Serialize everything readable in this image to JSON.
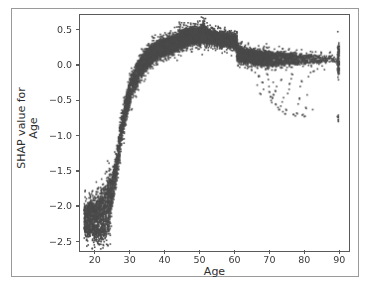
{
  "figure": {
    "top_clipped_text": "",
    "caption_clipped_text": ""
  },
  "chart_data": {
    "type": "scatter",
    "title": "",
    "subtitle": "",
    "xlabel": "Age",
    "ylabel_line1": "SHAP value for",
    "ylabel_line2": "Age",
    "ylabel": "SHAP value for Age",
    "xlim": [
      15.5,
      92.5
    ],
    "ylim": [
      -2.62,
      0.72
    ],
    "xticks": [
      20,
      30,
      40,
      50,
      60,
      70,
      80,
      90
    ],
    "xticklabels": [
      "20",
      "30",
      "40",
      "50",
      "60",
      "70",
      "80",
      "90"
    ],
    "yticks": [
      0.5,
      0.0,
      -0.5,
      -1.0,
      -1.5,
      -2.0,
      -2.5
    ],
    "yticklabels": [
      "0.5",
      "0.0",
      "−0.5",
      "−1.0",
      "−1.5",
      "−2.0",
      "−2.5"
    ],
    "grid": false,
    "legend": null,
    "marker_color": "#4a4a4a",
    "marker_size": 1.6,
    "n_points_approx": 9000,
    "bands": [
      {
        "x": 17.0,
        "lo": -2.36,
        "hi": -2.02,
        "density": 1.0
      },
      {
        "x": 17.6,
        "lo": -2.4,
        "hi": -2.0,
        "density": 1.0
      },
      {
        "x": 18.2,
        "lo": -2.42,
        "hi": -1.98,
        "density": 1.0
      },
      {
        "x": 18.8,
        "lo": -2.44,
        "hi": -1.96,
        "density": 1.0
      },
      {
        "x": 19.4,
        "lo": -2.46,
        "hi": -1.94,
        "density": 1.0
      },
      {
        "x": 20.0,
        "lo": -2.47,
        "hi": -1.92,
        "density": 1.0
      },
      {
        "x": 20.6,
        "lo": -2.47,
        "hi": -1.9,
        "density": 1.0
      },
      {
        "x": 21.2,
        "lo": -2.46,
        "hi": -1.88,
        "density": 1.0
      },
      {
        "x": 21.8,
        "lo": -2.45,
        "hi": -1.84,
        "density": 1.0
      },
      {
        "x": 22.4,
        "lo": -2.43,
        "hi": -1.8,
        "density": 1.0
      },
      {
        "x": 23.0,
        "lo": -2.4,
        "hi": -1.74,
        "density": 1.0
      },
      {
        "x": 23.6,
        "lo": -2.36,
        "hi": -1.66,
        "density": 0.95
      },
      {
        "x": 24.0,
        "lo": -2.3,
        "hi": -1.56,
        "density": 0.8
      },
      {
        "x": 24.4,
        "lo": -2.1,
        "hi": -1.62,
        "density": 0.65
      },
      {
        "x": 24.8,
        "lo": -1.96,
        "hi": -1.58,
        "density": 0.6
      },
      {
        "x": 25.2,
        "lo": -1.86,
        "hi": -1.5,
        "density": 0.6
      },
      {
        "x": 25.6,
        "lo": -1.74,
        "hi": -1.4,
        "density": 0.6
      },
      {
        "x": 26.0,
        "lo": -1.62,
        "hi": -1.28,
        "density": 0.6
      },
      {
        "x": 26.4,
        "lo": -1.48,
        "hi": -1.14,
        "density": 0.6
      },
      {
        "x": 26.8,
        "lo": -1.34,
        "hi": -1.0,
        "density": 0.6
      },
      {
        "x": 27.2,
        "lo": -1.2,
        "hi": -0.86,
        "density": 0.6
      },
      {
        "x": 27.6,
        "lo": -1.06,
        "hi": -0.74,
        "density": 0.6
      },
      {
        "x": 28.0,
        "lo": -0.94,
        "hi": -0.62,
        "density": 0.62
      },
      {
        "x": 28.4,
        "lo": -0.84,
        "hi": -0.52,
        "density": 0.64
      },
      {
        "x": 28.8,
        "lo": -0.74,
        "hi": -0.44,
        "density": 0.66
      },
      {
        "x": 29.2,
        "lo": -0.66,
        "hi": -0.36,
        "density": 0.68
      },
      {
        "x": 29.6,
        "lo": -0.58,
        "hi": -0.28,
        "density": 0.7
      },
      {
        "x": 30.0,
        "lo": -0.5,
        "hi": -0.2,
        "density": 0.72
      },
      {
        "x": 30.6,
        "lo": -0.42,
        "hi": -0.12,
        "density": 0.74
      },
      {
        "x": 31.2,
        "lo": -0.34,
        "hi": -0.05,
        "density": 0.76
      },
      {
        "x": 31.8,
        "lo": -0.28,
        "hi": 0.01,
        "density": 0.78
      },
      {
        "x": 32.4,
        "lo": -0.22,
        "hi": 0.06,
        "density": 0.8
      },
      {
        "x": 33.0,
        "lo": -0.17,
        "hi": 0.11,
        "density": 0.82
      },
      {
        "x": 33.6,
        "lo": -0.12,
        "hi": 0.15,
        "density": 0.84
      },
      {
        "x": 34.2,
        "lo": -0.08,
        "hi": 0.19,
        "density": 0.86
      },
      {
        "x": 34.8,
        "lo": -0.04,
        "hi": 0.22,
        "density": 0.88
      },
      {
        "x": 35.4,
        "lo": -0.01,
        "hi": 0.25,
        "density": 0.9
      },
      {
        "x": 36.0,
        "lo": 0.02,
        "hi": 0.28,
        "density": 0.92
      },
      {
        "x": 36.6,
        "lo": 0.05,
        "hi": 0.3,
        "density": 0.93
      },
      {
        "x": 37.2,
        "lo": 0.08,
        "hi": 0.32,
        "density": 0.94
      },
      {
        "x": 37.8,
        "lo": 0.1,
        "hi": 0.33,
        "density": 0.95
      },
      {
        "x": 38.4,
        "lo": 0.12,
        "hi": 0.35,
        "density": 0.95
      },
      {
        "x": 39.0,
        "lo": 0.13,
        "hi": 0.36,
        "density": 0.95
      },
      {
        "x": 39.6,
        "lo": 0.14,
        "hi": 0.37,
        "density": 0.95
      },
      {
        "x": 40.2,
        "lo": 0.15,
        "hi": 0.38,
        "density": 0.95
      },
      {
        "x": 40.8,
        "lo": 0.16,
        "hi": 0.39,
        "density": 0.95
      },
      {
        "x": 41.4,
        "lo": 0.17,
        "hi": 0.4,
        "density": 0.95
      },
      {
        "x": 42.0,
        "lo": 0.18,
        "hi": 0.41,
        "density": 0.95
      },
      {
        "x": 42.6,
        "lo": 0.19,
        "hi": 0.42,
        "density": 0.95
      },
      {
        "x": 43.2,
        "lo": 0.2,
        "hi": 0.43,
        "density": 0.95
      },
      {
        "x": 43.8,
        "lo": 0.21,
        "hi": 0.45,
        "density": 0.96
      },
      {
        "x": 44.4,
        "lo": 0.24,
        "hi": 0.49,
        "density": 1.0
      },
      {
        "x": 45.0,
        "lo": 0.26,
        "hi": 0.5,
        "density": 1.0
      },
      {
        "x": 45.6,
        "lo": 0.27,
        "hi": 0.5,
        "density": 1.0
      },
      {
        "x": 46.2,
        "lo": 0.28,
        "hi": 0.51,
        "density": 1.0
      },
      {
        "x": 46.8,
        "lo": 0.29,
        "hi": 0.51,
        "density": 1.0
      },
      {
        "x": 47.4,
        "lo": 0.29,
        "hi": 0.52,
        "density": 1.0
      },
      {
        "x": 48.0,
        "lo": 0.3,
        "hi": 0.52,
        "density": 1.0
      },
      {
        "x": 48.6,
        "lo": 0.3,
        "hi": 0.53,
        "density": 1.0
      },
      {
        "x": 49.2,
        "lo": 0.31,
        "hi": 0.53,
        "density": 1.0
      },
      {
        "x": 49.8,
        "lo": 0.31,
        "hi": 0.54,
        "density": 1.0
      },
      {
        "x": 50.4,
        "lo": 0.32,
        "hi": 0.55,
        "density": 1.0
      },
      {
        "x": 51.0,
        "lo": 0.32,
        "hi": 0.58,
        "density": 1.0
      },
      {
        "x": 51.6,
        "lo": 0.32,
        "hi": 0.55,
        "density": 1.0
      },
      {
        "x": 52.2,
        "lo": 0.32,
        "hi": 0.52,
        "density": 1.0
      },
      {
        "x": 52.8,
        "lo": 0.31,
        "hi": 0.5,
        "density": 1.0
      },
      {
        "x": 53.4,
        "lo": 0.31,
        "hi": 0.49,
        "density": 1.0
      },
      {
        "x": 54.0,
        "lo": 0.3,
        "hi": 0.48,
        "density": 1.0
      },
      {
        "x": 54.6,
        "lo": 0.3,
        "hi": 0.48,
        "density": 1.0
      },
      {
        "x": 55.2,
        "lo": 0.29,
        "hi": 0.47,
        "density": 1.0
      },
      {
        "x": 55.8,
        "lo": 0.29,
        "hi": 0.47,
        "density": 1.0
      },
      {
        "x": 56.4,
        "lo": 0.28,
        "hi": 0.46,
        "density": 1.0
      },
      {
        "x": 57.0,
        "lo": 0.28,
        "hi": 0.46,
        "density": 1.0
      },
      {
        "x": 57.6,
        "lo": 0.27,
        "hi": 0.45,
        "density": 1.0
      },
      {
        "x": 58.2,
        "lo": 0.27,
        "hi": 0.45,
        "density": 1.0
      },
      {
        "x": 58.8,
        "lo": 0.26,
        "hi": 0.45,
        "density": 1.0
      },
      {
        "x": 59.4,
        "lo": 0.26,
        "hi": 0.44,
        "density": 1.0
      },
      {
        "x": 60.0,
        "lo": 0.25,
        "hi": 0.44,
        "density": 1.0
      },
      {
        "x": 60.6,
        "lo": 0.24,
        "hi": 0.43,
        "density": 1.0
      },
      {
        "x": 61.0,
        "lo": 0.08,
        "hi": 0.3,
        "density": 0.9
      },
      {
        "x": 61.6,
        "lo": 0.06,
        "hi": 0.26,
        "density": 0.88
      },
      {
        "x": 62.2,
        "lo": 0.05,
        "hi": 0.24,
        "density": 0.86
      },
      {
        "x": 62.8,
        "lo": 0.04,
        "hi": 0.23,
        "density": 0.85
      },
      {
        "x": 63.4,
        "lo": 0.04,
        "hi": 0.22,
        "density": 0.84
      },
      {
        "x": 64.0,
        "lo": 0.03,
        "hi": 0.22,
        "density": 0.83
      },
      {
        "x": 64.6,
        "lo": 0.03,
        "hi": 0.21,
        "density": 0.82
      },
      {
        "x": 65.2,
        "lo": 0.02,
        "hi": 0.21,
        "density": 0.81
      },
      {
        "x": 65.8,
        "lo": 0.02,
        "hi": 0.2,
        "density": 0.8
      },
      {
        "x": 66.4,
        "lo": 0.02,
        "hi": 0.2,
        "density": 0.79
      },
      {
        "x": 67.0,
        "lo": 0.01,
        "hi": 0.2,
        "density": 0.78
      },
      {
        "x": 67.6,
        "lo": 0.01,
        "hi": 0.19,
        "density": 0.77
      },
      {
        "x": 68.2,
        "lo": 0.01,
        "hi": 0.19,
        "density": 0.75
      },
      {
        "x": 68.8,
        "lo": 0.0,
        "hi": 0.19,
        "density": 0.73
      },
      {
        "x": 69.4,
        "lo": 0.0,
        "hi": 0.19,
        "density": 0.71
      },
      {
        "x": 70.0,
        "lo": 0.0,
        "hi": 0.19,
        "density": 0.69
      },
      {
        "x": 70.8,
        "lo": 0.0,
        "hi": 0.18,
        "density": 0.66
      },
      {
        "x": 71.6,
        "lo": 0.0,
        "hi": 0.18,
        "density": 0.63
      },
      {
        "x": 72.4,
        "lo": 0.0,
        "hi": 0.18,
        "density": 0.6
      },
      {
        "x": 73.2,
        "lo": 0.01,
        "hi": 0.18,
        "density": 0.57
      },
      {
        "x": 74.0,
        "lo": 0.01,
        "hi": 0.18,
        "density": 0.54
      },
      {
        "x": 74.8,
        "lo": 0.01,
        "hi": 0.17,
        "density": 0.51
      },
      {
        "x": 75.6,
        "lo": 0.01,
        "hi": 0.17,
        "density": 0.48
      },
      {
        "x": 76.4,
        "lo": 0.02,
        "hi": 0.17,
        "density": 0.45
      },
      {
        "x": 77.2,
        "lo": 0.02,
        "hi": 0.17,
        "density": 0.43
      },
      {
        "x": 78.0,
        "lo": 0.02,
        "hi": 0.16,
        "density": 0.41
      },
      {
        "x": 79.0,
        "lo": 0.02,
        "hi": 0.16,
        "density": 0.38
      },
      {
        "x": 80.0,
        "lo": 0.03,
        "hi": 0.16,
        "density": 0.35
      },
      {
        "x": 81.0,
        "lo": 0.03,
        "hi": 0.15,
        "density": 0.31
      },
      {
        "x": 82.0,
        "lo": 0.03,
        "hi": 0.15,
        "density": 0.28
      },
      {
        "x": 83.0,
        "lo": 0.03,
        "hi": 0.15,
        "density": 0.25
      },
      {
        "x": 84.0,
        "lo": 0.04,
        "hi": 0.14,
        "density": 0.22
      },
      {
        "x": 85.0,
        "lo": 0.04,
        "hi": 0.14,
        "density": 0.19
      },
      {
        "x": 86.0,
        "lo": 0.04,
        "hi": 0.13,
        "density": 0.16
      },
      {
        "x": 87.0,
        "lo": 0.04,
        "hi": 0.13,
        "density": 0.13
      },
      {
        "x": 88.0,
        "lo": 0.05,
        "hi": 0.13,
        "density": 0.11
      },
      {
        "x": 89.0,
        "lo": 0.05,
        "hi": 0.12,
        "density": 0.09
      },
      {
        "x": 90.0,
        "lo": -0.1,
        "hi": 0.27,
        "density": 1.0
      }
    ],
    "outliers": [
      {
        "x": 69.0,
        "y": -0.06
      },
      {
        "x": 69.4,
        "y": -0.12
      },
      {
        "x": 69.8,
        "y": -0.2
      },
      {
        "x": 70.0,
        "y": -0.3
      },
      {
        "x": 70.2,
        "y": -0.38
      },
      {
        "x": 70.4,
        "y": -0.45
      },
      {
        "x": 70.6,
        "y": -0.5
      },
      {
        "x": 70.8,
        "y": -0.53
      },
      {
        "x": 71.0,
        "y": -0.47
      },
      {
        "x": 71.4,
        "y": -0.42
      },
      {
        "x": 71.8,
        "y": -0.36
      },
      {
        "x": 72.2,
        "y": -0.3
      },
      {
        "x": 72.0,
        "y": -0.56
      },
      {
        "x": 72.6,
        "y": -0.6
      },
      {
        "x": 73.0,
        "y": -0.63
      },
      {
        "x": 73.4,
        "y": -0.58
      },
      {
        "x": 73.8,
        "y": -0.52
      },
      {
        "x": 74.2,
        "y": -0.46
      },
      {
        "x": 74.0,
        "y": -0.66
      },
      {
        "x": 74.6,
        "y": -0.69
      },
      {
        "x": 75.0,
        "y": -0.64
      },
      {
        "x": 75.4,
        "y": -0.4
      },
      {
        "x": 75.8,
        "y": -0.34
      },
      {
        "x": 76.0,
        "y": -0.26
      },
      {
        "x": 76.4,
        "y": -0.19
      },
      {
        "x": 76.8,
        "y": -0.13
      },
      {
        "x": 77.0,
        "y": -0.7
      },
      {
        "x": 77.6,
        "y": -0.72
      },
      {
        "x": 78.0,
        "y": -0.68
      },
      {
        "x": 78.4,
        "y": -0.55
      },
      {
        "x": 78.8,
        "y": -0.48
      },
      {
        "x": 79.0,
        "y": -0.3
      },
      {
        "x": 79.4,
        "y": -0.22
      },
      {
        "x": 79.8,
        "y": -0.7
      },
      {
        "x": 80.2,
        "y": -0.73
      },
      {
        "x": 80.6,
        "y": -0.6
      },
      {
        "x": 81.0,
        "y": -0.42
      },
      {
        "x": 81.4,
        "y": -0.16
      },
      {
        "x": 82.0,
        "y": -0.1
      },
      {
        "x": 82.6,
        "y": -0.63
      },
      {
        "x": 83.0,
        "y": -0.08
      },
      {
        "x": 84.0,
        "y": -0.05
      },
      {
        "x": 66.0,
        "y": -0.1
      },
      {
        "x": 67.0,
        "y": -0.16
      },
      {
        "x": 68.0,
        "y": -0.24
      },
      {
        "x": 68.4,
        "y": -0.34
      },
      {
        "x": 66.6,
        "y": -0.28
      },
      {
        "x": 67.4,
        "y": -0.4
      },
      {
        "x": 65.0,
        "y": -0.07
      },
      {
        "x": 71.2,
        "y": -0.24
      },
      {
        "x": 73.6,
        "y": -0.2
      },
      {
        "x": 90.0,
        "y": -0.71
      },
      {
        "x": 90.0,
        "y": -0.74
      },
      {
        "x": 90.0,
        "y": -0.77
      },
      {
        "x": 90.0,
        "y": -0.8
      },
      {
        "x": 89.8,
        "y": -0.73
      },
      {
        "x": 86.0,
        "y": -0.06
      },
      {
        "x": 30.5,
        "y": -0.62
      },
      {
        "x": 27.0,
        "y": -1.38
      },
      {
        "x": 24.6,
        "y": -1.66
      },
      {
        "x": 23.2,
        "y": -1.52
      },
      {
        "x": 22.0,
        "y": -1.7
      },
      {
        "x": 20.5,
        "y": -1.76
      },
      {
        "x": 19.0,
        "y": -1.8
      },
      {
        "x": 25.0,
        "y": -1.44
      },
      {
        "x": 26.0,
        "y": -1.34
      },
      {
        "x": 44.5,
        "y": 0.58
      },
      {
        "x": 51.0,
        "y": 0.62
      },
      {
        "x": 51.4,
        "y": 0.6
      },
      {
        "x": 36.5,
        "y": 0.4
      },
      {
        "x": 60.8,
        "y": 0.47
      },
      {
        "x": 62.0,
        "y": 0.33
      },
      {
        "x": 64.0,
        "y": 0.3
      },
      {
        "x": 67.0,
        "y": 0.28
      },
      {
        "x": 70.0,
        "y": 0.26
      },
      {
        "x": 74.0,
        "y": 0.24
      },
      {
        "x": 78.0,
        "y": 0.22
      },
      {
        "x": 82.0,
        "y": 0.2
      },
      {
        "x": 85.0,
        "y": 0.19
      },
      {
        "x": 87.5,
        "y": 0.18
      }
    ]
  }
}
